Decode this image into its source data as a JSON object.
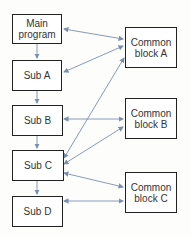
{
  "diagram": {
    "left_column": [
      {
        "id": "main",
        "label": "Main\nprogram"
      },
      {
        "id": "sub_a",
        "label": "Sub A"
      },
      {
        "id": "sub_b",
        "label": "Sub B"
      },
      {
        "id": "sub_c",
        "label": "Sub C"
      },
      {
        "id": "sub_d",
        "label": "Sub D"
      }
    ],
    "right_column": [
      {
        "id": "common_a",
        "label": "Common\nblock A"
      },
      {
        "id": "common_b",
        "label": "Common\nblock B"
      },
      {
        "id": "common_c",
        "label": "Common\nblock C"
      }
    ],
    "call_edges": [
      [
        "main",
        "sub_a"
      ],
      [
        "sub_a",
        "sub_b"
      ],
      [
        "sub_b",
        "sub_c"
      ],
      [
        "sub_c",
        "sub_d"
      ]
    ],
    "data_edges": [
      [
        "main",
        "common_a"
      ],
      [
        "sub_a",
        "common_a"
      ],
      [
        "sub_c",
        "common_a"
      ],
      [
        "sub_b",
        "common_b"
      ],
      [
        "sub_c",
        "common_b"
      ],
      [
        "sub_c",
        "common_c"
      ],
      [
        "sub_d",
        "common_c"
      ]
    ],
    "arrow_color": "#7a8fb0"
  }
}
